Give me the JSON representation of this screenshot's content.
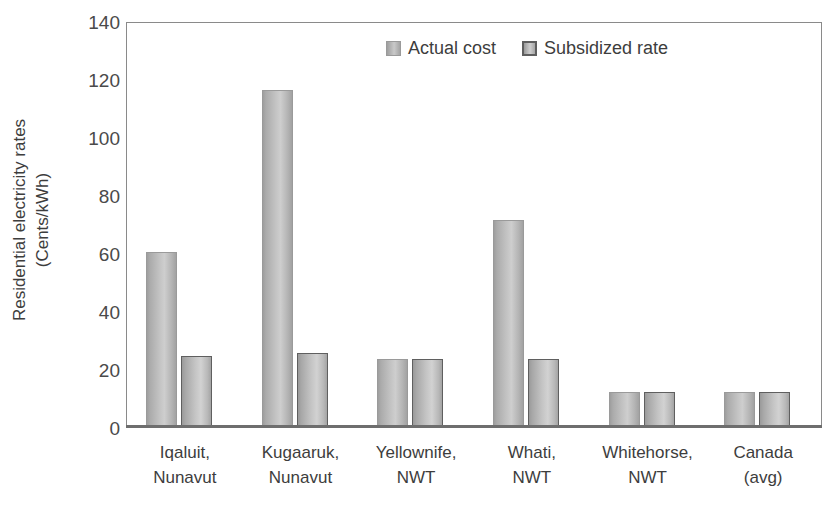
{
  "chart_data": {
    "type": "bar",
    "title": "",
    "xlabel": "",
    "ylabel": "Residential electricity rates (Cents/kWh)",
    "ylabel_lines": [
      "Residential electricity rates",
      "(Cents/kWh)"
    ],
    "ylim": [
      0,
      140
    ],
    "yticks": [
      140,
      120,
      100,
      80,
      60,
      40,
      20,
      0
    ],
    "ytick_labels": [
      "140",
      "120",
      "100",
      "80",
      "60",
      "40",
      "20",
      "0"
    ],
    "grid": false,
    "legend_position": "top-center",
    "categories": [
      "Iqaluit, Nunavut",
      "Kugaaruk, Nunavut",
      "Yellownife, NWT",
      "Whati, NWT",
      "Whitehorse, NWT",
      "Canada (avg)"
    ],
    "category_lines": [
      [
        "Iqaluit,",
        "Nunavut"
      ],
      [
        "Kugaaruk,",
        "Nunavut"
      ],
      [
        "Yellownife,",
        "NWT"
      ],
      [
        "Whati,",
        "NWT"
      ],
      [
        "Whitehorse,",
        "NWT"
      ],
      [
        "Canada",
        "(avg)"
      ]
    ],
    "series": [
      {
        "name": "Actual cost",
        "color": "#c2c2c2",
        "values": [
          61,
          117,
          24,
          72,
          12.5,
          12.5
        ]
      },
      {
        "name": "Subsidized rate",
        "color": "#c4c4c4",
        "values": [
          25,
          26,
          24,
          24,
          12.5,
          12.5
        ]
      }
    ]
  },
  "legend": {
    "items": [
      {
        "label": "Actual cost",
        "marker": "legend-swatch-actual-cost"
      },
      {
        "label": "Subsidized rate",
        "marker": "legend-swatch-subsidized-rate"
      }
    ]
  },
  "colors": {
    "axis": "#8a8a8a",
    "baseline": "#6e6e6e",
    "text": "#3d3d3d",
    "bar_actual": "#c2c2c2",
    "bar_subsidized": "#c4c4c4",
    "bar_subsidized_border": "#5f5f5f"
  }
}
